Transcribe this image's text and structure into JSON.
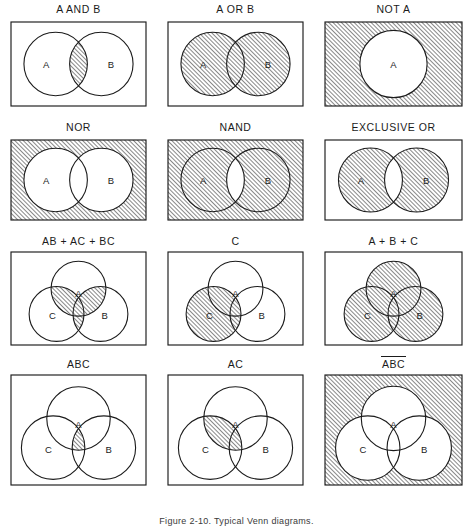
{
  "figure": {
    "caption": "Figure 2-10.  Typical Venn diagrams.",
    "hatch_color": "#1b1b1b",
    "line_color": "#1b1b1b",
    "background": "#ffffff"
  },
  "cells": [
    {
      "id": "a-and-b",
      "title": "A AND B",
      "overbar": false,
      "type": "two-circle",
      "labels": [
        "A",
        "B"
      ],
      "shaded": [
        "AB"
      ]
    },
    {
      "id": "a-or-b",
      "title": "A OR B",
      "overbar": false,
      "type": "two-circle",
      "labels": [
        "A",
        "B"
      ],
      "shaded": [
        "A",
        "B",
        "AB"
      ]
    },
    {
      "id": "not-a",
      "title": "NOT A",
      "overbar": false,
      "type": "one-circle",
      "labels": [
        "A"
      ],
      "shaded": [
        "outside"
      ]
    },
    {
      "id": "nor",
      "title": "NOR",
      "overbar": false,
      "type": "two-circle",
      "labels": [
        "A",
        "B"
      ],
      "shaded": [
        "outside"
      ]
    },
    {
      "id": "nand",
      "title": "NAND",
      "overbar": false,
      "type": "two-circle",
      "labels": [
        "A",
        "B"
      ],
      "shaded": [
        "outside",
        "A",
        "B"
      ]
    },
    {
      "id": "exclusive-or",
      "title": "EXCLUSIVE OR",
      "overbar": false,
      "type": "two-circle",
      "labels": [
        "A",
        "B"
      ],
      "shaded": [
        "A",
        "B"
      ]
    },
    {
      "id": "ab-ac-bc",
      "title": "AB + AC + BC",
      "overbar": false,
      "type": "three-circle",
      "labels": [
        "A",
        "B",
        "C"
      ],
      "shaded": [
        "AB",
        "AC",
        "BC",
        "ABC"
      ]
    },
    {
      "id": "c",
      "title": "C",
      "overbar": false,
      "type": "three-circle",
      "labels": [
        "A",
        "B",
        "C"
      ],
      "shaded": [
        "C",
        "AC",
        "BC",
        "ABC"
      ]
    },
    {
      "id": "a-plus-b-plus-c",
      "title": "A + B + C",
      "overbar": false,
      "type": "three-circle",
      "labels": [
        "A",
        "B",
        "C"
      ],
      "shaded": [
        "A",
        "B",
        "C",
        "AB",
        "AC",
        "BC",
        "ABC"
      ]
    },
    {
      "id": "abc",
      "title": "ABC",
      "overbar": false,
      "type": "three-circle",
      "labels": [
        "A",
        "B",
        "C"
      ],
      "shaded": [
        "ABC"
      ]
    },
    {
      "id": "ac",
      "title": "AC",
      "overbar": false,
      "type": "three-circle",
      "labels": [
        "A",
        "B",
        "C"
      ],
      "shaded": [
        "AC",
        "ABC"
      ]
    },
    {
      "id": "not-abc",
      "title": "ABC",
      "overbar": true,
      "type": "three-circle",
      "labels": [
        "A",
        "B",
        "C"
      ],
      "shaded": [
        "outside"
      ]
    }
  ]
}
